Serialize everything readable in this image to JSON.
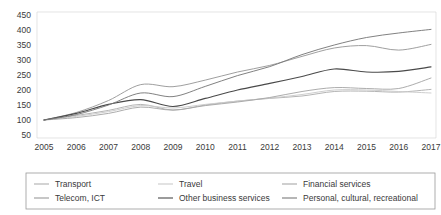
{
  "chart_data": {
    "type": "line",
    "title": "",
    "subtitle": "",
    "xlabel": "",
    "ylabel": "",
    "grid": false,
    "legend_position": "bottom",
    "x": [
      2005,
      2006,
      2007,
      2008,
      2009,
      2010,
      2011,
      2012,
      2013,
      2014,
      2015,
      2016,
      2017
    ],
    "xtick_labels": [
      "2005",
      "2006",
      "2007",
      "2008",
      "2009",
      "2010",
      "2011",
      "2012",
      "2013",
      "2014",
      "2015",
      "2016",
      "2017"
    ],
    "ytick_labels": [
      "50",
      "100",
      "150",
      "200",
      "250",
      "300",
      "350",
      "400",
      "450"
    ],
    "yticks": [
      50,
      100,
      150,
      200,
      250,
      300,
      350,
      400,
      450
    ],
    "ylim": [
      50,
      450
    ],
    "series": [
      {
        "name": "Transport",
        "color": "#b0b0b0",
        "values": [
          100,
          115,
          132,
          152,
          133,
          150,
          163,
          172,
          180,
          195,
          196,
          193,
          202
        ]
      },
      {
        "name": "Travel",
        "color": "#cbcbcb",
        "values": [
          100,
          112,
          128,
          148,
          140,
          152,
          163,
          173,
          185,
          200,
          200,
          195,
          190
        ]
      },
      {
        "name": "Financial services",
        "color": "#a8a8a8",
        "values": [
          100,
          108,
          122,
          143,
          133,
          148,
          160,
          175,
          195,
          208,
          205,
          205,
          240
        ]
      },
      {
        "name": "Telecom, ICT",
        "color": "#9a9a9a",
        "values": [
          100,
          125,
          165,
          218,
          211,
          233,
          260,
          282,
          312,
          340,
          348,
          333,
          352
        ]
      },
      {
        "name": "Other business services",
        "color": "#4a4a4a",
        "values": [
          100,
          122,
          152,
          168,
          145,
          172,
          200,
          222,
          245,
          270,
          260,
          262,
          277
        ]
      },
      {
        "name": "Personal, cultural, recreational",
        "color": "#7a7a7a",
        "values": [
          100,
          118,
          150,
          190,
          178,
          212,
          248,
          278,
          318,
          350,
          375,
          390,
          402
        ]
      }
    ]
  },
  "legend": {
    "entries": [
      {
        "label": "Transport",
        "color": "#b0b0b0"
      },
      {
        "label": "Travel",
        "color": "#cbcbcb"
      },
      {
        "label": "Financial services",
        "color": "#a8a8a8"
      },
      {
        "label": "Telecom, ICT",
        "color": "#9a9a9a"
      },
      {
        "label": "Other business services",
        "color": "#4a4a4a"
      },
      {
        "label": "Personal, cultural, recreational",
        "color": "#7a7a7a"
      }
    ]
  },
  "colors": {
    "axis": "#d8d8d8",
    "text": "#3a3a3a",
    "legend_border": "#9a9a9a",
    "background": "#ffffff"
  }
}
